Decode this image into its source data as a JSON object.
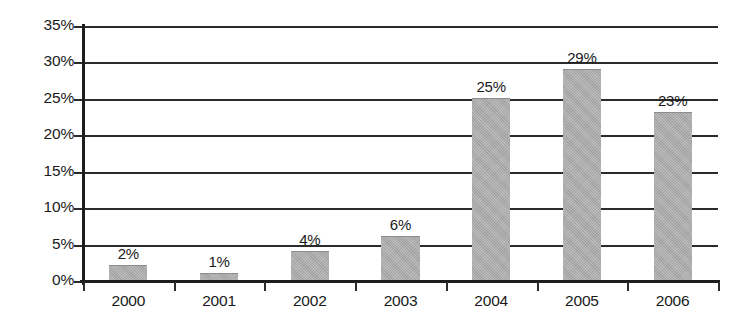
{
  "chart_data": {
    "type": "bar",
    "title": "",
    "subtitle": "",
    "xlabel": "",
    "ylabel": "",
    "categories": [
      "2000",
      "2001",
      "2002",
      "2003",
      "2004",
      "2005",
      "2006"
    ],
    "values": [
      2,
      1,
      4,
      6,
      25,
      29,
      23
    ],
    "value_labels": [
      "2%",
      "1%",
      "4%",
      "6%",
      "25%",
      "29%",
      "23%"
    ],
    "ylim": [
      0,
      35
    ],
    "ytick_values": [
      0,
      5,
      10,
      15,
      20,
      25,
      30,
      35
    ],
    "ytick_labels": [
      "0%",
      "5%",
      "10%",
      "15%",
      "20%",
      "25%",
      "30%",
      "35%"
    ],
    "grid": true,
    "grid_axis": "y",
    "legend": false,
    "legend_position": "none",
    "series": [
      {
        "name": "",
        "values": [
          2,
          1,
          4,
          6,
          25,
          29,
          23
        ]
      }
    ],
    "colors": {
      "bar_fill": "#a9a9a9",
      "bar_edge": "#8d8d8d",
      "axis": "#1e1e1e",
      "gridline": "#2b2b2b",
      "text": "#1a1a1a",
      "background": "#ffffff"
    }
  }
}
